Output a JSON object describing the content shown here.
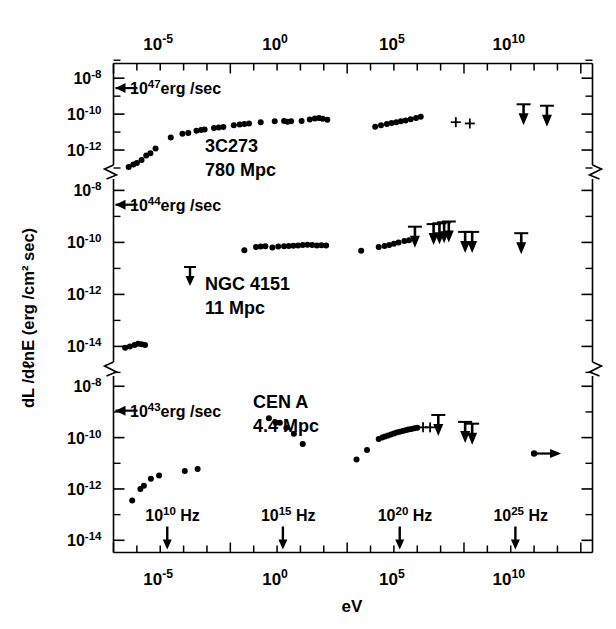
{
  "figure": {
    "xlabel_bottom": "eV",
    "ylabel": "dL /dℓnE (erg /cm² sec)"
  },
  "axes": {
    "top_ticks": [
      {
        "label_mantissa": "10",
        "label_exp": "-5"
      },
      {
        "label_mantissa": "10",
        "label_exp": "0"
      },
      {
        "label_mantissa": "10",
        "label_exp": "5"
      },
      {
        "label_mantissa": "10",
        "label_exp": "10"
      }
    ],
    "bottom_ticks": [
      {
        "label_mantissa": "10",
        "label_exp": "-5"
      },
      {
        "label_mantissa": "10",
        "label_exp": "0"
      },
      {
        "label_mantissa": "10",
        "label_exp": "5"
      },
      {
        "label_mantissa": "10",
        "label_exp": "10"
      }
    ],
    "freq_markers": [
      {
        "mantissa": "10",
        "exp": "10",
        "unit": "Hz"
      },
      {
        "mantissa": "10",
        "exp": "15",
        "unit": "Hz"
      },
      {
        "mantissa": "10",
        "exp": "20",
        "unit": "Hz"
      },
      {
        "mantissa": "10",
        "exp": "25",
        "unit": "Hz"
      }
    ],
    "y_ticks": [
      {
        "mantissa": "10",
        "exp": "-8"
      },
      {
        "mantissa": "10",
        "exp": "-10"
      },
      {
        "mantissa": "10",
        "exp": "-12"
      },
      {
        "mantissa": "10",
        "exp": "-8"
      },
      {
        "mantissa": "10",
        "exp": "-10"
      },
      {
        "mantissa": "10",
        "exp": "-12"
      },
      {
        "mantissa": "10",
        "exp": "-14"
      },
      {
        "mantissa": "10",
        "exp": "-8"
      },
      {
        "mantissa": "10",
        "exp": "-10"
      },
      {
        "mantissa": "10",
        "exp": "-12"
      },
      {
        "mantissa": "10",
        "exp": "-14"
      }
    ]
  },
  "panels": [
    {
      "id": "3c273",
      "name": "3C273",
      "distance": "780 Mpc",
      "luminosity_mantissa": "10",
      "luminosity_exp": "47",
      "luminosity_unit": "erg /sec"
    },
    {
      "id": "ngc4151",
      "name": "NGC 4151",
      "distance": "11 Mpc",
      "luminosity_mantissa": "10",
      "luminosity_exp": "44",
      "luminosity_unit": "erg /sec"
    },
    {
      "id": "cena",
      "name": "CEN A",
      "distance": "4.4 Mpc",
      "luminosity_mantissa": "10",
      "luminosity_exp": "43",
      "luminosity_unit": "erg /sec"
    }
  ],
  "chart_data": {
    "type": "scatter",
    "title": "",
    "xlabel": "eV",
    "ylabel": "dL/dlnE (erg/cm^2 sec)",
    "xlim_log10": [
      -7.0,
      13.5
    ],
    "xscale": "log",
    "yscale": "log",
    "grid": false,
    "legend": "none",
    "panels": [
      {
        "name": "3C273",
        "distance": "780 Mpc",
        "luminosity_marker": "10^47 erg/sec",
        "ylim_log10": [
          -13.0,
          -7.6
        ],
        "ytick_log10": [
          -8,
          -10,
          -12
        ],
        "series": [
          {
            "name": "detections",
            "marker": "filled-circle",
            "points_log10": [
              [
                -6.35,
                -12.95
              ],
              [
                -6.15,
                -12.8
              ],
              [
                -6.0,
                -12.72
              ],
              [
                -5.8,
                -12.55
              ],
              [
                -5.6,
                -12.3
              ],
              [
                -5.42,
                -12.18
              ],
              [
                -5.2,
                -11.92
              ],
              [
                -4.55,
                -11.3
              ],
              [
                -4.05,
                -11.1
              ],
              [
                -3.8,
                -11.05
              ],
              [
                -3.45,
                -10.92
              ],
              [
                -3.25,
                -10.88
              ],
              [
                -3.1,
                -10.85
              ],
              [
                -2.7,
                -10.78
              ],
              [
                -2.5,
                -10.74
              ],
              [
                -2.3,
                -10.72
              ],
              [
                -1.85,
                -10.62
              ],
              [
                -1.6,
                -10.58
              ],
              [
                -1.4,
                -10.55
              ],
              [
                -1.2,
                -10.52
              ],
              [
                -0.7,
                -10.45
              ],
              [
                -0.1,
                -10.4
              ],
              [
                0.3,
                -10.38
              ],
              [
                0.45,
                -10.42
              ],
              [
                0.6,
                -10.4
              ],
              [
                1.05,
                -10.38
              ],
              [
                1.4,
                -10.3
              ],
              [
                1.62,
                -10.25
              ],
              [
                1.8,
                -10.22
              ],
              [
                1.95,
                -10.26
              ],
              [
                2.15,
                -10.32
              ],
              [
                4.2,
                -10.7
              ],
              [
                4.45,
                -10.62
              ],
              [
                4.7,
                -10.55
              ],
              [
                4.9,
                -10.5
              ],
              [
                5.1,
                -10.45
              ],
              [
                5.3,
                -10.4
              ],
              [
                5.5,
                -10.35
              ],
              [
                5.72,
                -10.28
              ],
              [
                5.95,
                -10.22
              ],
              [
                6.15,
                -10.15
              ]
            ]
          },
          {
            "name": "plus-markers",
            "marker": "plus",
            "points_log10": [
              [
                7.65,
                -10.45
              ],
              [
                8.25,
                -10.52
              ]
            ]
          },
          {
            "name": "upper-limits",
            "marker": "down-arrow",
            "points_log10": [
              [
                10.55,
                -10.4
              ],
              [
                11.55,
                -10.48
              ]
            ]
          }
        ]
      },
      {
        "name": "NGC 4151",
        "distance": "11 Mpc",
        "luminosity_marker": "10^44 erg/sec",
        "ylim_log10": [
          -14.6,
          -7.6
        ],
        "ytick_log10": [
          -8,
          -10,
          -12,
          -14
        ],
        "series": [
          {
            "name": "radio",
            "marker": "filled-circle",
            "points_log10": [
              [
                -6.5,
                -14.05
              ],
              [
                -6.3,
                -14.0
              ],
              [
                -6.1,
                -13.95
              ],
              [
                -5.95,
                -13.9
              ],
              [
                -5.8,
                -13.92
              ],
              [
                -5.65,
                -13.95
              ]
            ]
          },
          {
            "name": "infrared-optical",
            "marker": "filled-circle",
            "points_log10": [
              [
                -1.4,
                -10.3
              ],
              [
                -0.9,
                -10.18
              ],
              [
                -0.7,
                -10.16
              ],
              [
                -0.5,
                -10.15
              ],
              [
                -0.2,
                -10.2
              ],
              [
                0.05,
                -10.16
              ],
              [
                0.3,
                -10.15
              ],
              [
                0.5,
                -10.14
              ],
              [
                0.7,
                -10.13
              ],
              [
                0.9,
                -10.12
              ],
              [
                1.1,
                -10.1
              ],
              [
                1.3,
                -10.09
              ],
              [
                1.5,
                -10.1
              ],
              [
                1.7,
                -10.12
              ],
              [
                1.9,
                -10.11
              ],
              [
                2.1,
                -10.12
              ]
            ]
          },
          {
            "name": "x-ray",
            "marker": "filled-circle",
            "points_log10": [
              [
                3.6,
                -10.32
              ],
              [
                4.35,
                -10.18
              ],
              [
                4.6,
                -10.14
              ],
              [
                4.8,
                -10.1
              ],
              [
                5.0,
                -10.05
              ],
              [
                5.2,
                -10.0
              ],
              [
                5.45,
                -9.95
              ],
              [
                5.65,
                -9.92
              ]
            ]
          },
          {
            "name": "upper-limits",
            "marker": "down-arrow",
            "points_log10": [
              [
                5.9,
                -10.05
              ],
              [
                6.7,
                -9.95
              ],
              [
                6.95,
                -9.92
              ],
              [
                7.15,
                -9.88
              ],
              [
                7.35,
                -9.85
              ],
              [
                8.05,
                -10.25
              ],
              [
                8.35,
                -10.25
              ],
              [
                10.45,
                -10.3
              ]
            ]
          }
        ]
      },
      {
        "name": "CEN A",
        "distance": "4.4 Mpc",
        "luminosity_marker": "10^43 erg/sec",
        "ylim_log10": [
          -14.3,
          -7.6
        ],
        "ytick_log10": [
          -8,
          -10,
          -12,
          -14
        ],
        "series": [
          {
            "name": "radio",
            "marker": "filled-circle",
            "points_log10": [
              [
                -6.2,
                -12.45
              ],
              [
                -5.85,
                -12.0
              ],
              [
                -5.7,
                -11.88
              ],
              [
                -5.4,
                -11.6
              ],
              [
                -5.05,
                -11.48
              ],
              [
                -3.95,
                -11.3
              ],
              [
                -3.4,
                -11.22
              ]
            ]
          },
          {
            "name": "infrared-optical",
            "marker": "filled-circle",
            "points_log10": [
              [
                -0.35,
                -9.25
              ],
              [
                -0.05,
                -9.42
              ],
              [
                0.12,
                -9.42
              ],
              [
                0.4,
                -9.62
              ],
              [
                0.72,
                -9.85
              ],
              [
                1.1,
                -10.25
              ]
            ]
          },
          {
            "name": "x-ray",
            "marker": "filled-circle",
            "points_log10": [
              [
                3.4,
                -10.85
              ],
              [
                3.85,
                -10.48
              ],
              [
                4.35,
                -10.05
              ],
              [
                4.5,
                -10.0
              ],
              [
                4.62,
                -9.96
              ],
              [
                4.75,
                -9.92
              ],
              [
                4.88,
                -9.88
              ],
              [
                5.0,
                -9.84
              ],
              [
                5.12,
                -9.8
              ],
              [
                5.25,
                -9.77
              ],
              [
                5.38,
                -9.74
              ],
              [
                5.5,
                -9.71
              ],
              [
                5.62,
                -9.68
              ],
              [
                5.75,
                -9.66
              ],
              [
                5.88,
                -9.64
              ],
              [
                6.0,
                -9.62
              ]
            ]
          },
          {
            "name": "plus-markers",
            "marker": "plus",
            "points_log10": [
              [
                6.25,
                -9.6
              ],
              [
                6.55,
                -9.6
              ]
            ]
          },
          {
            "name": "upper-limits",
            "marker": "down-arrow",
            "points_log10": [
              [
                6.9,
                -9.78
              ],
              [
                8.05,
                -10.05
              ],
              [
                8.35,
                -10.12
              ]
            ]
          },
          {
            "name": "detection-with-range",
            "marker": "circle-right-arrow",
            "points_log10": [
              [
                11.0,
                -10.62
              ]
            ]
          }
        ]
      }
    ]
  }
}
